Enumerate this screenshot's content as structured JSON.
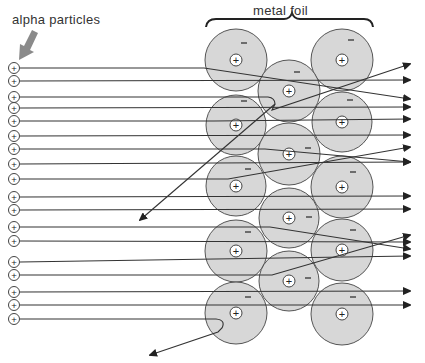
{
  "labels": {
    "alpha_particles": "alpha particles",
    "metal_foil": "metal foil"
  },
  "symbols": {
    "nucleus": "+",
    "electron": "−",
    "alpha": "+"
  },
  "colors": {
    "atom_fill": "#d0d0d0",
    "atom_stroke": "#555555",
    "line": "#333333",
    "pointer_arrow": "#8a8a8a",
    "text": "#333333"
  },
  "atoms": [
    {
      "cx": 236,
      "cy": 60,
      "r": 31,
      "ex": 244,
      "ey": 43
    },
    {
      "cx": 342,
      "cy": 60,
      "r": 31,
      "ex": 351,
      "ey": 40
    },
    {
      "cx": 289,
      "cy": 91,
      "r": 31,
      "ex": 297,
      "ey": 72
    },
    {
      "cx": 236,
      "cy": 125,
      "r": 30,
      "ex": 244,
      "ey": 101
    },
    {
      "cx": 342,
      "cy": 122,
      "r": 30,
      "ex": 350,
      "ey": 100
    },
    {
      "cx": 289,
      "cy": 154,
      "r": 31,
      "ex": 308,
      "ey": 148
    },
    {
      "cx": 236,
      "cy": 186,
      "r": 30,
      "ex": 248,
      "ey": 169
    },
    {
      "cx": 342,
      "cy": 187,
      "r": 31,
      "ex": 353,
      "ey": 172
    },
    {
      "cx": 289,
      "cy": 218,
      "r": 30,
      "ex": 309,
      "ey": 217
    },
    {
      "cx": 236,
      "cy": 251,
      "r": 31,
      "ex": 248,
      "ey": 232
    },
    {
      "cx": 342,
      "cy": 250,
      "r": 31,
      "ex": 353,
      "ey": 230
    },
    {
      "cx": 289,
      "cy": 281,
      "r": 30,
      "ex": 308,
      "ey": 278
    },
    {
      "cx": 236,
      "cy": 313,
      "r": 31,
      "ex": 248,
      "ey": 297
    },
    {
      "cx": 342,
      "cy": 314,
      "r": 31,
      "ex": 353,
      "ey": 297
    }
  ],
  "particles": [
    {
      "y": 68,
      "path": "M20,68 L204,68 L410,99"
    },
    {
      "y": 81,
      "path": "M20,81 L410,80"
    },
    {
      "y": 97,
      "path": "M20,97 L268,97 Q275,98 275,104 L272,110 L410,64"
    },
    {
      "y": 108,
      "path": "M20,108 L410,107"
    },
    {
      "y": 121,
      "path": "M20,121 L214,121 L410,119"
    },
    {
      "y": 136,
      "path": "M20,136 L410,135"
    },
    {
      "y": 149,
      "path": "M20,149 L265,149 L410,162"
    },
    {
      "y": 164,
      "path": "M20,164 L410,162"
    },
    {
      "y": 179,
      "path": "M20,179 L228,179 L410,147"
    },
    {
      "y": 197,
      "path": "M20,197 L410,196"
    },
    {
      "y": 210,
      "path": "M20,210 L410,209"
    },
    {
      "y": 227,
      "path": "M20,227 L270,227 L410,249"
    },
    {
      "y": 241,
      "path": "M20,241 L410,242"
    },
    {
      "y": 262,
      "path": "M20,262 L410,256"
    },
    {
      "y": 275,
      "path": "M20,275 L272,275 L410,235"
    },
    {
      "y": 292,
      "path": "M20,292 L410,291"
    },
    {
      "y": 305,
      "path": "M20,305 L410,305"
    },
    {
      "y": 319,
      "path": "M20,319 L216,319 Q226,320 222,328 L218,332 L150,355"
    }
  ],
  "backscatter": [
    {
      "path": "M275,104 L140,220"
    }
  ]
}
